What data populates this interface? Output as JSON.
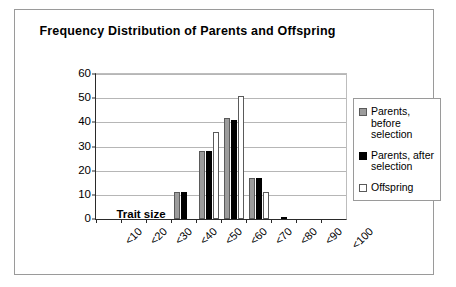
{
  "chart_data": {
    "type": "bar",
    "title": "Frequency Distribution of Parents and Offspring",
    "xlabel": "Trait size",
    "ylabel": "Number of individuals",
    "categories": [
      "<10",
      "<20",
      "<30",
      "<40",
      "<50",
      "<60",
      "<70",
      "<80",
      "<90",
      "<100"
    ],
    "series": [
      {
        "name": "Parents, before selection",
        "color": "#9c9c9c",
        "values": [
          0,
          0,
          0,
          11,
          28,
          42,
          17,
          0,
          0,
          0
        ]
      },
      {
        "name": "Parents, after selection",
        "color": "#000000",
        "values": [
          0,
          0,
          0,
          11,
          28,
          41,
          17,
          1,
          0,
          0
        ]
      },
      {
        "name": "Offspring",
        "color": "#ffffff",
        "values": [
          0,
          0,
          0,
          0,
          36,
          51,
          11,
          0,
          0,
          0
        ]
      }
    ],
    "ylim": [
      0,
      60
    ],
    "yticks": [
      0,
      10,
      20,
      30,
      40,
      50,
      60
    ],
    "grid": true,
    "legend_position": "right"
  }
}
